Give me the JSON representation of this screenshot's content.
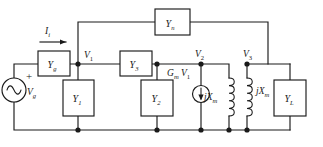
{
  "figure": {
    "name": "two-port-network-small-signal-equivalent-circuit",
    "ink_color": "#1a1a1a",
    "background_color": "#ffffff"
  },
  "sources": {
    "generator": {
      "symbol": "ac-sine-source",
      "label_main": "V",
      "label_sub": "g",
      "polarity": "+"
    },
    "dependent_current_source": {
      "symbol": "current-source-arrow-down",
      "label_main": "G",
      "label_sub": "m",
      "label_main2": "V",
      "label_sub2": "1"
    }
  },
  "current": {
    "label_main": "I",
    "label_sub": "i",
    "direction": "right"
  },
  "nodes": [
    {
      "id": "v1",
      "label_main": "V",
      "label_sub": "1"
    },
    {
      "id": "v2",
      "label_main": "V",
      "label_sub": "2"
    },
    {
      "id": "v3",
      "label_main": "V",
      "label_sub": "3"
    }
  ],
  "components": [
    {
      "id": "yg",
      "type": "admittance-box",
      "label_main": "Y",
      "label_sub": "g",
      "orientation": "horizontal"
    },
    {
      "id": "yn",
      "type": "admittance-box",
      "label_main": "Y",
      "label_sub": "n",
      "orientation": "horizontal"
    },
    {
      "id": "y3",
      "type": "admittance-box",
      "label_main": "Y",
      "label_sub": "3",
      "orientation": "horizontal"
    },
    {
      "id": "y1",
      "type": "admittance-box",
      "label_main": "Y",
      "label_sub": "1",
      "orientation": "vertical"
    },
    {
      "id": "y2",
      "type": "admittance-box",
      "label_main": "Y",
      "label_sub": "2",
      "orientation": "vertical"
    },
    {
      "id": "yl",
      "type": "admittance-box",
      "label_main": "Y",
      "label_sub": "L",
      "orientation": "vertical"
    },
    {
      "id": "jxm-primary",
      "type": "inductor-coil",
      "label_main": "jX",
      "label_sub": "m"
    },
    {
      "id": "jxm-secondary",
      "type": "inductor-coil",
      "label_main": "jX",
      "label_sub": "m"
    }
  ]
}
